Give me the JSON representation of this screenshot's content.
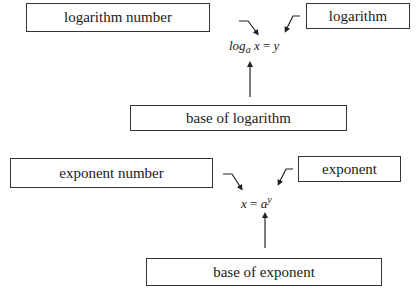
{
  "log_section": {
    "labels": {
      "log_number": "logarithm number",
      "logarithm": "logarithm",
      "base": "base of logarithm"
    },
    "equation": {
      "fn": "log",
      "base": "a",
      "arg": "x",
      "eq": "=",
      "result": "y"
    }
  },
  "exp_section": {
    "labels": {
      "exp_number": "exponent number",
      "exponent": "exponent",
      "base": "base of exponent"
    },
    "equation": {
      "lhs": "x",
      "eq": "=",
      "base": "a",
      "power": "y"
    }
  },
  "colors": {
    "line": "#333333",
    "text": "#1a1a1a",
    "background": "#ffffff"
  }
}
